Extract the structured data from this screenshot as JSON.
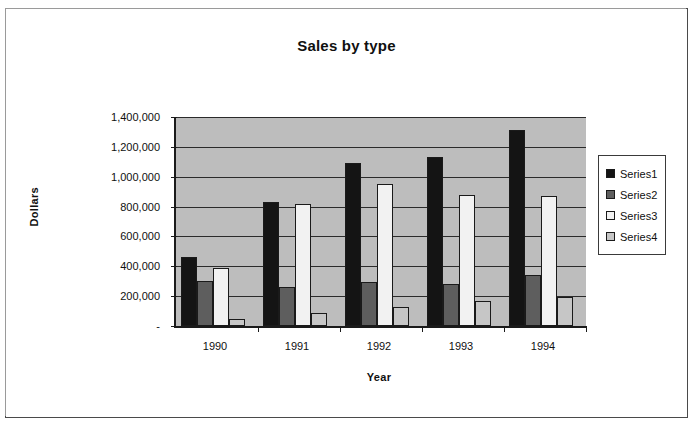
{
  "chart_data": {
    "type": "bar",
    "title": "Sales by type",
    "xlabel": "Year",
    "ylabel": "Dollars",
    "categories": [
      "1990",
      "1991",
      "1992",
      "1993",
      "1994"
    ],
    "series": [
      {
        "name": "Series1",
        "color": "#141414",
        "values": [
          460000,
          830000,
          1090000,
          1135000,
          1310000
        ]
      },
      {
        "name": "Series2",
        "color": "#5e5e5e",
        "values": [
          300000,
          260000,
          295000,
          280000,
          345000
        ]
      },
      {
        "name": "Series3",
        "color": "#f2f2f2",
        "values": [
          390000,
          820000,
          950000,
          880000,
          870000
        ]
      },
      {
        "name": "Series4",
        "color": "#c6c6c6",
        "values": [
          50000,
          85000,
          130000,
          165000,
          195000
        ]
      }
    ],
    "ylim": [
      0,
      1400000
    ],
    "ytick_values": [
      0,
      200000,
      400000,
      600000,
      800000,
      1000000,
      1200000,
      1400000
    ],
    "ytick_labels": [
      "-",
      "200,000",
      "400,000",
      "600,000",
      "800,000",
      "1,000,000",
      "1,200,000",
      "1,400,000"
    ],
    "grid": true,
    "legend_position": "right",
    "plot_background": "#bdbdbd"
  }
}
